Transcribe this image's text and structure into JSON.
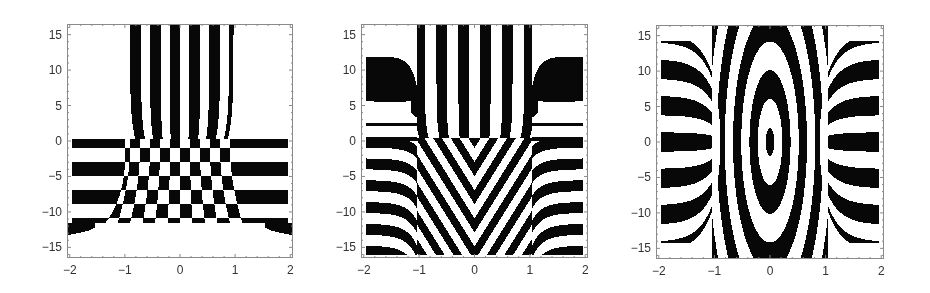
{
  "chart_data": [
    {
      "type": "heatmap",
      "title": "",
      "xlabel": "",
      "ylabel": "",
      "xlim": [
        -2.05,
        2.05
      ],
      "ylim": [
        -16.5,
        16.5
      ],
      "xticks": [
        "-2",
        "-1",
        "0",
        "1",
        "2"
      ],
      "yticks": [
        "15",
        "10",
        "5",
        "0",
        "-5",
        "-10",
        "-15"
      ],
      "colormap": [
        "#000000",
        "#ffffff"
      ],
      "pattern": "vertical fringes (11 dark stripes) for |x|<1, y>0; horizontal fringes for y<0 outside |x|<1 down to y≈-11.5; checkerboard inside |x|<1, y<0",
      "frame_px": {
        "left": 67,
        "top": 24,
        "right": 293,
        "bottom": 258
      }
    },
    {
      "type": "heatmap",
      "title": "",
      "xlabel": "",
      "ylabel": "",
      "xlim": [
        -2.05,
        2.05
      ],
      "ylim": [
        -16.5,
        16.5
      ],
      "xticks": [
        "-2",
        "-1",
        "0",
        "1",
        "2"
      ],
      "yticks": [
        "15",
        "10",
        "5",
        "0",
        "-5",
        "-10",
        "-15"
      ],
      "colormap": [
        "#000000",
        "#ffffff"
      ],
      "pattern": "vertical fringes (10 dark stripes) for |x|<1, y>0; inverted-V diagonal fringes for y<0; curved horizontal bands for |x|>1",
      "frame_px": {
        "left": 361,
        "top": 24,
        "right": 588,
        "bottom": 258
      }
    },
    {
      "type": "heatmap",
      "title": "",
      "xlabel": "",
      "ylabel": "",
      "xlim": [
        -2.05,
        2.05
      ],
      "ylim": [
        -16.5,
        16.5
      ],
      "xticks": [
        "-2",
        "-1",
        "0",
        "1",
        "2"
      ],
      "yticks": [
        "15",
        "10",
        "5",
        "0",
        "-5",
        "-10",
        "-15"
      ],
      "colormap": [
        "#000000",
        "#ffffff"
      ],
      "pattern": "symmetric X-shaped hourglass fringes centred at origin; curved horizontal bands for |x|>1",
      "frame_px": {
        "left": 656,
        "top": 25,
        "right": 884,
        "bottom": 259
      }
    }
  ],
  "panels": [
    {
      "id": "panel-1",
      "mode": 1,
      "left": 67,
      "top": 24,
      "width": 226,
      "height": 234
    },
    {
      "id": "panel-2",
      "mode": 2,
      "left": 361,
      "top": 24,
      "width": 227,
      "height": 234
    },
    {
      "id": "panel-3",
      "mode": 3,
      "left": 656,
      "top": 25,
      "width": 228,
      "height": 234
    }
  ],
  "axis": {
    "x_ticks": [
      {
        "v": -2,
        "label": "-2"
      },
      {
        "v": -1,
        "label": "-1"
      },
      {
        "v": 0,
        "label": "0"
      },
      {
        "v": 1,
        "label": "1"
      },
      {
        "v": 2,
        "label": "2"
      }
    ],
    "y_ticks": [
      {
        "v": 15,
        "label": "15"
      },
      {
        "v": 10,
        "label": "10"
      },
      {
        "v": 5,
        "label": "5"
      },
      {
        "v": 0,
        "label": "0"
      },
      {
        "v": -5,
        "label": "-5"
      },
      {
        "v": -10,
        "label": "-10"
      },
      {
        "v": -15,
        "label": "-15"
      }
    ],
    "xmin": -2.05,
    "xmax": 2.05,
    "ymin": -16.5,
    "ymax": 16.5,
    "tick_color": "#8a8a8a",
    "label_color": "#333333"
  }
}
